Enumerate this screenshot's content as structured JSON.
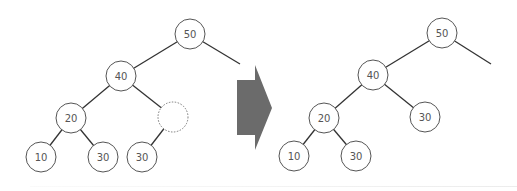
{
  "diagram": {
    "title": "",
    "type": "binary-tree-transformation",
    "before_tree": {
      "nodes": [
        {
          "id": "b50",
          "label": "50",
          "x": 190,
          "y": 34
        },
        {
          "id": "b40",
          "label": "40",
          "x": 121,
          "y": 76
        },
        {
          "id": "b20",
          "label": "20",
          "x": 71,
          "y": 118
        },
        {
          "id": "bempty",
          "label": "",
          "x": 173,
          "y": 117,
          "style": "dotted"
        },
        {
          "id": "b10",
          "label": "10",
          "x": 41,
          "y": 157
        },
        {
          "id": "b30a",
          "label": "30",
          "x": 103,
          "y": 157
        },
        {
          "id": "b30b",
          "label": "30",
          "x": 142,
          "y": 157
        }
      ],
      "edges": [
        [
          "b50",
          "b40"
        ],
        [
          "b40",
          "b20"
        ],
        [
          "b40",
          "bempty"
        ],
        [
          "b20",
          "b10"
        ],
        [
          "b20",
          "b30a"
        ],
        [
          "bempty",
          "b30b"
        ]
      ],
      "dangling_edge": {
        "from": "b50",
        "to_x": 240,
        "to_y": 64
      }
    },
    "arrow": {
      "direction": "right",
      "color": "#6b6b6b"
    },
    "after_tree": {
      "nodes": [
        {
          "id": "a50",
          "label": "50",
          "x": 442,
          "y": 33
        },
        {
          "id": "a40",
          "label": "40",
          "x": 373,
          "y": 75
        },
        {
          "id": "a20",
          "label": "20",
          "x": 324,
          "y": 118
        },
        {
          "id": "a30r",
          "label": "30",
          "x": 425,
          "y": 117
        },
        {
          "id": "a10",
          "label": "10",
          "x": 294,
          "y": 156
        },
        {
          "id": "a30",
          "label": "30",
          "x": 356,
          "y": 156
        }
      ],
      "edges": [
        [
          "a50",
          "a40"
        ],
        [
          "a40",
          "a20"
        ],
        [
          "a40",
          "a30r"
        ],
        [
          "a20",
          "a10"
        ],
        [
          "a20",
          "a30"
        ]
      ],
      "dangling_edge": {
        "from": "a50",
        "to_x": 491,
        "to_y": 64
      }
    }
  }
}
